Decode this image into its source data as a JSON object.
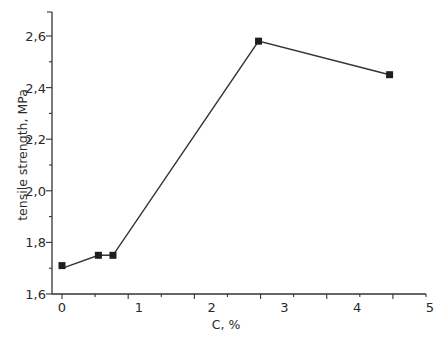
{
  "chart_data": {
    "type": "line",
    "title": "",
    "xlabel": "C, %",
    "ylabel": "tensile strength, MPa",
    "xlim": [
      0,
      5
    ],
    "ylim": [
      1.6,
      2.7
    ],
    "x_ticks": [
      0,
      1,
      2,
      3,
      4,
      5
    ],
    "x_tick_labels": [
      "0",
      "1",
      "2",
      "3",
      "4",
      "5"
    ],
    "y_ticks": [
      1.6,
      1.8,
      2.0,
      2.2,
      2.4,
      2.6
    ],
    "y_tick_labels": [
      "1,6",
      "1,8",
      "2,0",
      "2,2",
      "2,4",
      "2,6"
    ],
    "grid": false,
    "legend": null,
    "series": [
      {
        "name": "tensile strength",
        "marker": "square",
        "color": "#1e1e1e",
        "x": [
          0,
          0.5,
          0.7,
          2.7,
          4.5
        ],
        "y": [
          1.71,
          1.75,
          1.75,
          2.58,
          2.45
        ]
      }
    ]
  }
}
